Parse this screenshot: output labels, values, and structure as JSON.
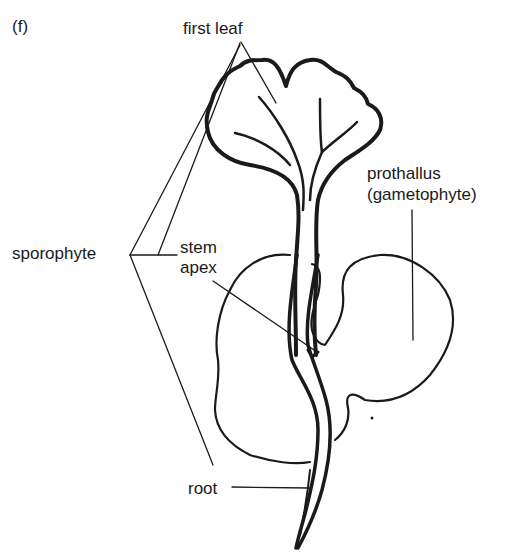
{
  "figure": {
    "panel_label": "(f)",
    "labels": {
      "first_leaf": "first leaf",
      "prothallus_line1": "prothallus",
      "prothallus_line2": "(gametophyte)",
      "sporophyte": "sporophyte",
      "stem_line1": "stem",
      "stem_line2": "apex",
      "root": "root"
    }
  },
  "colors": {
    "ink": "#1a1a1a",
    "background": "#ffffff"
  }
}
